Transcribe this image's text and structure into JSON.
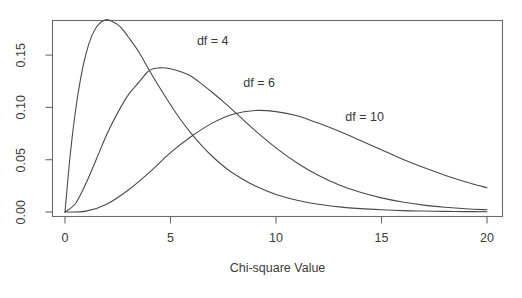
{
  "chart_data": {
    "type": "line",
    "title": "",
    "subtitle": "",
    "xlabel": "Chi-square Value",
    "ylabel": "",
    "xlim": [
      0,
      20
    ],
    "ylim": [
      0.0,
      0.19
    ],
    "grid": false,
    "legend_position": "inline-annotations",
    "xticks": [
      "0",
      "5",
      "10",
      "15",
      "20"
    ],
    "xtick_values": [
      0,
      5,
      10,
      15,
      20
    ],
    "yticks": [
      "0.00",
      "0.05",
      "0.10",
      "0.15"
    ],
    "ytick_values": [
      0.0,
      0.05,
      0.1,
      0.15
    ],
    "line_color": "#4a4a4a",
    "axis_color": "#6b6b6b",
    "annotations": [
      {
        "text": "df = 4",
        "x": 7.0,
        "y": 0.163
      },
      {
        "text": "df = 6",
        "x": 9.2,
        "y": 0.122
      },
      {
        "text": "df = 10",
        "x": 14.2,
        "y": 0.09
      }
    ],
    "series": [
      {
        "name": "df = 4",
        "df": 4,
        "mode_x": 2.0,
        "mode_y": 0.1839,
        "x": [
          0,
          0.25,
          0.5,
          0.75,
          1,
          1.25,
          1.5,
          1.75,
          2,
          2.25,
          2.5,
          2.75,
          3,
          3.5,
          4,
          4.5,
          5,
          5.5,
          6,
          6.5,
          7,
          7.5,
          8,
          9,
          10,
          11,
          12,
          13,
          14,
          15,
          16,
          17,
          18,
          19,
          20
        ],
        "values": [
          0.0,
          0.0552,
          0.0973,
          0.1288,
          0.1516,
          0.1674,
          0.1771,
          0.1822,
          0.1839,
          0.182,
          0.1791,
          0.1742,
          0.1673,
          0.153,
          0.1353,
          0.1185,
          0.1026,
          0.0877,
          0.0747,
          0.063,
          0.0528,
          0.044,
          0.0366,
          0.025,
          0.0168,
          0.0113,
          0.0074,
          0.0049,
          0.0032,
          0.0021,
          0.0013,
          0.0009,
          0.0006,
          0.0004,
          0.0002
        ]
      },
      {
        "name": "df = 6",
        "df": 6,
        "mode_x": 4.0,
        "mode_y": 0.1353,
        "x": [
          0,
          0.5,
          1,
          1.5,
          2,
          2.5,
          3,
          3.5,
          4,
          4.5,
          5,
          5.5,
          6,
          6.5,
          7,
          7.5,
          8,
          9,
          10,
          11,
          12,
          13,
          14,
          15,
          16,
          17,
          18,
          19,
          20
        ],
        "values": [
          0.0,
          0.0081,
          0.0277,
          0.0512,
          0.0751,
          0.095,
          0.112,
          0.124,
          0.1353,
          0.1378,
          0.137,
          0.134,
          0.1295,
          0.122,
          0.114,
          0.1055,
          0.0965,
          0.078,
          0.0613,
          0.0469,
          0.0352,
          0.0259,
          0.0188,
          0.0135,
          0.0095,
          0.0066,
          0.0046,
          0.0031,
          0.0021
        ]
      },
      {
        "name": "df = 10",
        "df": 10,
        "mode_x": 8.0,
        "mode_y": 0.0977,
        "x": [
          0,
          1,
          2,
          3,
          4,
          5,
          6,
          7,
          8,
          9,
          10,
          11,
          12,
          13,
          14,
          15,
          16,
          17,
          18,
          19,
          20
        ],
        "values": [
          0.0,
          0.0008,
          0.0077,
          0.021,
          0.0379,
          0.0567,
          0.0724,
          0.0852,
          0.0937,
          0.097,
          0.096,
          0.092,
          0.085,
          0.0771,
          0.0684,
          0.0594,
          0.0505,
          0.0425,
          0.0352,
          0.0287,
          0.0232
        ]
      }
    ]
  }
}
